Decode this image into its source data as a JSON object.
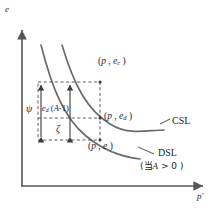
{
  "figure": {
    "type": "economics-diagram",
    "background": "#ffffff",
    "ink_color": "#4a4a4a",
    "text_color": "#1d1d1d"
  },
  "axes": {
    "y_label": "e",
    "x_label": "p'",
    "origin": {
      "x": 22,
      "y": 186
    },
    "y_top": {
      "x": 22,
      "y": 28
    },
    "x_right": {
      "x": 205,
      "y": 186
    }
  },
  "curves": [
    {
      "id": "csl",
      "label": "CSL",
      "label_x": 172,
      "label_y": 122,
      "start": {
        "x": 62,
        "y": 45
      },
      "end": {
        "x": 163,
        "y": 130
      }
    },
    {
      "id": "dsl",
      "label": "DSL",
      "note": "(当 A > 0 )",
      "note_symbol": "A",
      "note_prefix": "当",
      "note_suffix": "> 0",
      "label_x": 158,
      "label_y": 155,
      "note_x": 142,
      "note_y": 168,
      "start": {
        "x": 41,
        "y": 45
      },
      "end": {
        "x": 140,
        "y": 158
      }
    }
  ],
  "points": [
    {
      "id": "point-ec",
      "base": "p",
      "value": "e",
      "value_sub": "c",
      "label": "(p , e_c )",
      "x": 100,
      "y": 82,
      "label_x": 98,
      "label_y": 63
    },
    {
      "id": "point-ed",
      "base": "p",
      "value": "e",
      "value_sub": "d",
      "label": "(p , e_d )",
      "x": 100,
      "y": 118,
      "label_x": 94,
      "label_y": 114
    },
    {
      "id": "point-e",
      "base": "p",
      "value": "e",
      "value_sub": "",
      "label": "(p , e )",
      "x": 100,
      "y": 140,
      "label_x": 88,
      "label_y": 142
    }
  ],
  "dashed_box": {
    "left": 38,
    "right": 100,
    "top": 82,
    "bottom": 140
  },
  "dashed_inner_line": {
    "y": 118,
    "left": 38,
    "right": 100
  },
  "measures": [
    {
      "id": "psi-measure",
      "symbol": "ψ",
      "symbol_x": 28,
      "symbol_y": 106,
      "arrow_x": 41,
      "top": 84,
      "bottom": 138
    },
    {
      "id": "zeta-measure",
      "symbol": "ζ",
      "symbol_x": 56,
      "symbol_y": 126,
      "arrow_x": 70,
      "top": 84,
      "bottom": 138
    }
  ],
  "annotations": [
    {
      "id": "ed-a-minus-1",
      "text": "e_d (A-1)",
      "base": "e",
      "sub": "d",
      "tail": "(A-1)",
      "x": 42,
      "y": 108
    }
  ]
}
